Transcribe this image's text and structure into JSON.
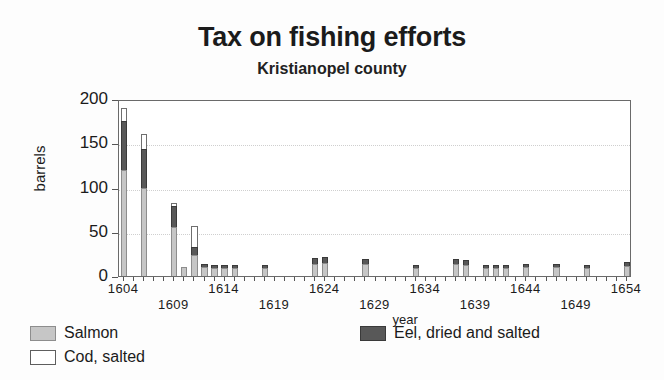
{
  "chart_data": {
    "type": "bar",
    "title": "Tax on fishing efforts",
    "subtitle": "Kristianopel county",
    "xlabel": "year",
    "ylabel": "barrels",
    "ylim": [
      0,
      200
    ],
    "yticks": [
      0,
      50,
      100,
      150,
      200
    ],
    "xlim": [
      1604,
      1654
    ],
    "grid": true,
    "stacked": true,
    "legend_position": "below-left",
    "xticks_major": [
      1604,
      1609,
      1614,
      1619,
      1624,
      1629,
      1634,
      1639,
      1644,
      1649,
      1654
    ],
    "categories": [
      1604,
      1605,
      1606,
      1607,
      1608,
      1609,
      1610,
      1611,
      1612,
      1613,
      1614,
      1615,
      1616,
      1617,
      1618,
      1619,
      1620,
      1621,
      1622,
      1623,
      1624,
      1625,
      1626,
      1627,
      1628,
      1629,
      1630,
      1631,
      1632,
      1633,
      1634,
      1635,
      1636,
      1637,
      1638,
      1639,
      1640,
      1641,
      1642,
      1643,
      1644,
      1645,
      1646,
      1647,
      1648,
      1649,
      1650,
      1651,
      1652,
      1653,
      1654
    ],
    "series": [
      {
        "name": "Salmon",
        "color": "#c6c6c6",
        "values": [
          120,
          0,
          100,
          0,
          0,
          55,
          10,
          24,
          10,
          9,
          9,
          9,
          0,
          0,
          9,
          0,
          0,
          0,
          0,
          14,
          15,
          0,
          0,
          0,
          14,
          0,
          0,
          0,
          0,
          9,
          0,
          0,
          0,
          14,
          13,
          0,
          9,
          9,
          9,
          0,
          10,
          0,
          0,
          10,
          0,
          0,
          9,
          0,
          0,
          0,
          11
        ]
      },
      {
        "name": "Eel, dried and salted",
        "color": "#585858",
        "values": [
          55,
          0,
          43,
          0,
          0,
          24,
          0,
          9,
          4,
          4,
          4,
          4,
          0,
          0,
          3,
          0,
          0,
          0,
          0,
          6,
          6,
          0,
          0,
          0,
          5,
          0,
          0,
          0,
          0,
          4,
          0,
          0,
          0,
          5,
          5,
          0,
          4,
          4,
          4,
          0,
          4,
          0,
          0,
          4,
          0,
          0,
          4,
          0,
          0,
          0,
          5
        ]
      },
      {
        "name": "Cod, salted",
        "color": "#ffffff",
        "values": [
          15,
          0,
          17,
          0,
          0,
          3,
          0,
          23,
          0,
          0,
          0,
          0,
          0,
          0,
          0,
          0,
          0,
          0,
          0,
          0,
          0,
          0,
          0,
          0,
          0,
          0,
          0,
          0,
          0,
          0,
          0,
          0,
          0,
          0,
          0,
          0,
          0,
          0,
          0,
          0,
          0,
          0,
          0,
          0,
          0,
          0,
          0,
          0,
          0,
          0,
          0
        ]
      }
    ],
    "totals": [
      190,
      0,
      160,
      0,
      0,
      82,
      10,
      56,
      14,
      13,
      13,
      13,
      0,
      0,
      12,
      0,
      0,
      0,
      0,
      20,
      21,
      0,
      0,
      0,
      19,
      0,
      0,
      0,
      0,
      13,
      0,
      0,
      0,
      19,
      18,
      0,
      13,
      13,
      13,
      0,
      14,
      0,
      0,
      14,
      0,
      0,
      13,
      0,
      0,
      0,
      16
    ]
  },
  "legend": {
    "entries": [
      {
        "label": "Salmon"
      },
      {
        "label": "Cod, salted"
      },
      {
        "label": "Eel, dried and salted"
      }
    ]
  }
}
